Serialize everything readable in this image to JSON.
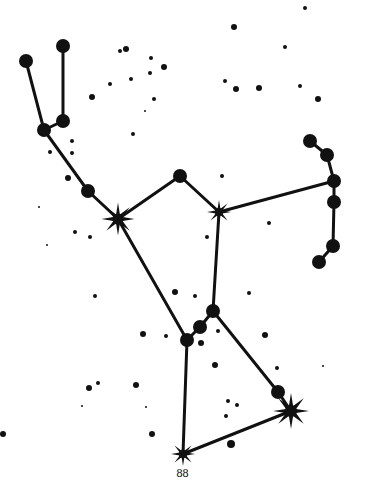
{
  "diagram": {
    "ink_color": "#111111",
    "background": "#ffffff"
  },
  "page_number": "88",
  "major_stars": [
    {
      "id": "a",
      "x": 26,
      "y": 61,
      "r": 7
    },
    {
      "id": "b",
      "x": 63,
      "y": 46,
      "r": 7
    },
    {
      "id": "c",
      "x": 63,
      "y": 121,
      "r": 7
    },
    {
      "id": "d",
      "x": 44,
      "y": 130,
      "r": 7
    },
    {
      "id": "e",
      "x": 88,
      "y": 191,
      "r": 7
    },
    {
      "id": "f",
      "x": 180,
      "y": 176,
      "r": 7
    },
    {
      "id": "g",
      "x": 310,
      "y": 141,
      "r": 7
    },
    {
      "id": "h",
      "x": 327,
      "y": 155,
      "r": 7
    },
    {
      "id": "i",
      "x": 334,
      "y": 181,
      "r": 7
    },
    {
      "id": "j",
      "x": 334,
      "y": 202,
      "r": 7
    },
    {
      "id": "k",
      "x": 333,
      "y": 246,
      "r": 7
    },
    {
      "id": "l",
      "x": 319,
      "y": 262,
      "r": 7
    },
    {
      "id": "m",
      "x": 213,
      "y": 311,
      "r": 7
    },
    {
      "id": "n",
      "x": 200,
      "y": 327,
      "r": 7
    },
    {
      "id": "o",
      "x": 187,
      "y": 340,
      "r": 7
    },
    {
      "id": "p",
      "x": 278,
      "y": 392,
      "r": 7
    }
  ],
  "bright_stars": [
    {
      "id": "betelgeuse",
      "x": 118,
      "y": 219,
      "r": 11
    },
    {
      "id": "bellatrix",
      "x": 219,
      "y": 212,
      "r": 8
    },
    {
      "id": "rigel",
      "x": 291,
      "y": 411,
      "r": 12
    },
    {
      "id": "saiph",
      "x": 183,
      "y": 454,
      "r": 8
    }
  ],
  "lines": [
    [
      "a",
      "d"
    ],
    [
      "b",
      "c"
    ],
    [
      "c",
      "d"
    ],
    [
      "d",
      "e"
    ],
    [
      "e",
      "betelgeuse"
    ],
    [
      "betelgeuse",
      "f"
    ],
    [
      "f",
      "bellatrix"
    ],
    [
      "bellatrix",
      "i"
    ],
    [
      "g",
      "h"
    ],
    [
      "h",
      "i"
    ],
    [
      "i",
      "j"
    ],
    [
      "j",
      "k"
    ],
    [
      "k",
      "l"
    ],
    [
      "betelgeuse",
      "o"
    ],
    [
      "bellatrix",
      "m"
    ],
    [
      "m",
      "n"
    ],
    [
      "n",
      "o"
    ],
    [
      "m",
      "p"
    ],
    [
      "p",
      "rigel"
    ],
    [
      "o",
      "saiph"
    ],
    [
      "saiph",
      "rigel"
    ]
  ],
  "minor_stars": [
    [
      120,
      51,
      2
    ],
    [
      126,
      49,
      3
    ],
    [
      151,
      58,
      2
    ],
    [
      164,
      67,
      3
    ],
    [
      131,
      79,
      2
    ],
    [
      150,
      73,
      2
    ],
    [
      92,
      97,
      3
    ],
    [
      110,
      84,
      2
    ],
    [
      154,
      99,
      2
    ],
    [
      145,
      111,
      1
    ],
    [
      133,
      134,
      2
    ],
    [
      72,
      141,
      2
    ],
    [
      72,
      153,
      2
    ],
    [
      50,
      152,
      2
    ],
    [
      68,
      178,
      3
    ],
    [
      39,
      207,
      1
    ],
    [
      75,
      232,
      2
    ],
    [
      90,
      237,
      2
    ],
    [
      47,
      245,
      1
    ],
    [
      234,
      27,
      3
    ],
    [
      305,
      8,
      2
    ],
    [
      285,
      47,
      2
    ],
    [
      225,
      81,
      2
    ],
    [
      236,
      89,
      3
    ],
    [
      259,
      88,
      3
    ],
    [
      300,
      86,
      2
    ],
    [
      318,
      99,
      3
    ],
    [
      222,
      176,
      2
    ],
    [
      269,
      223,
      2
    ],
    [
      207,
      237,
      2
    ],
    [
      95,
      296,
      2
    ],
    [
      143,
      334,
      3
    ],
    [
      166,
      336,
      2
    ],
    [
      175,
      292,
      3
    ],
    [
      89,
      388,
      3
    ],
    [
      98,
      383,
      2
    ],
    [
      82,
      406,
      1
    ],
    [
      136,
      385,
      3
    ],
    [
      146,
      407,
      1
    ],
    [
      152,
      434,
      3
    ],
    [
      3,
      434,
      3
    ],
    [
      249,
      293,
      2
    ],
    [
      218,
      331,
      2
    ],
    [
      201,
      343,
      3
    ],
    [
      215,
      365,
      3
    ],
    [
      265,
      335,
      3
    ],
    [
      277,
      368,
      2
    ],
    [
      323,
      366,
      1
    ],
    [
      228,
      401,
      2
    ],
    [
      237,
      405,
      2
    ],
    [
      226,
      416,
      2
    ],
    [
      231,
      444,
      4
    ],
    [
      195,
      296,
      2
    ]
  ]
}
